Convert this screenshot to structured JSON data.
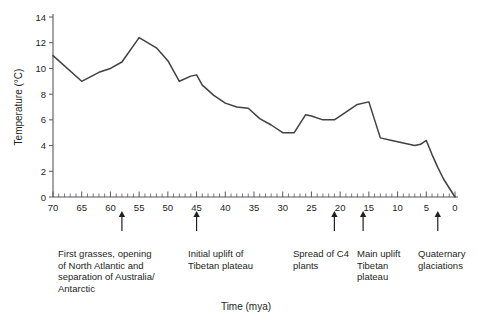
{
  "chart_data": {
    "type": "line",
    "title": "",
    "xlabel": "Time (mya)",
    "ylabel": "Temperature (°C)",
    "xlim": [
      70,
      0
    ],
    "ylim": [
      0,
      14
    ],
    "x_inverted": true,
    "grid": false,
    "legend": "none",
    "x_ticks": [
      70,
      65,
      60,
      55,
      50,
      45,
      40,
      35,
      30,
      25,
      20,
      15,
      10,
      5,
      0
    ],
    "x_tick_labels": [
      "70",
      "65",
      "60",
      "55",
      "50",
      "45",
      "40",
      "35",
      "30",
      "25",
      "20",
      "15",
      "10",
      "5",
      "0"
    ],
    "x_minor_tick_step": 1,
    "y_ticks": [
      0,
      2,
      4,
      6,
      8,
      10,
      12,
      14
    ],
    "y_tick_labels": [
      "0",
      "2",
      "4",
      "6",
      "8",
      "10",
      "12",
      "14"
    ],
    "series": [
      {
        "name": "Global temperature",
        "x": [
          70,
          65,
          62,
          60,
          58,
          55,
          52,
          50,
          48,
          46,
          45,
          44,
          42,
          40,
          38,
          36,
          34,
          32,
          30,
          28,
          26,
          25,
          23,
          21,
          19,
          17,
          15,
          14,
          13,
          11,
          9,
          7,
          6,
          5,
          4,
          3,
          2,
          1,
          0
        ],
        "y": [
          11.0,
          9.0,
          9.7,
          10.0,
          10.5,
          12.4,
          11.6,
          10.6,
          9.0,
          9.4,
          9.5,
          8.7,
          7.9,
          7.3,
          7.0,
          6.9,
          6.1,
          5.6,
          5.0,
          5.0,
          6.4,
          6.3,
          6.0,
          6.0,
          6.6,
          7.2,
          7.4,
          6.0,
          4.6,
          4.4,
          4.2,
          4.0,
          4.1,
          4.4,
          3.3,
          2.3,
          1.4,
          0.7,
          0.0
        ]
      }
    ],
    "annotations": [
      {
        "id": "first-grasses",
        "x_mya": 58,
        "text": "First grasses, opening\nof North Atlantic and\nseparation of Australia/\nAntarctic"
      },
      {
        "id": "initial-uplift",
        "x_mya": 45,
        "text": "Initial uplift of\nTibetan plateau"
      },
      {
        "id": "spread-c4",
        "x_mya": 21,
        "text": "Spread of C4\nplants"
      },
      {
        "id": "main-uplift",
        "x_mya": 16,
        "text": "Main uplift\nTibetan\nplateau"
      },
      {
        "id": "quaternary",
        "x_mya": 3,
        "text": "Quaternary\nglaciations"
      }
    ],
    "colors": {
      "line": "#414042",
      "axis": "#58595b",
      "text": "#231f20",
      "background": "#ffffff"
    }
  }
}
